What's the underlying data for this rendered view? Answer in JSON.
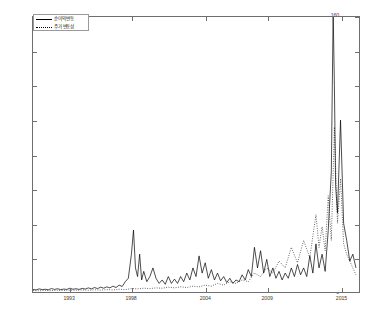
{
  "chart_data": {
    "type": "line",
    "title": "",
    "xlabel": "",
    "ylabel": "",
    "xlim": [
      1990.0,
      2016.5
    ],
    "ylim": [
      0,
      160
    ],
    "grid": false,
    "legend_position": "top-left",
    "x_ticks": [
      1993,
      1998,
      2004,
      2009,
      2015
    ],
    "x_tick_labels": [
      "1993",
      "1998",
      "2004",
      "2009",
      "2015"
    ],
    "y_ticks": [
      0,
      20,
      40,
      60,
      80,
      100,
      120,
      140,
      160
    ],
    "y_tick_labels": [
      "0",
      "20",
      "40",
      "60",
      "80",
      "100",
      "120",
      "140",
      "160"
    ],
    "series": [
      {
        "name": "순이익 변동",
        "style": "solid",
        "color": "#000000",
        "x": [
          1990.0,
          1990.25,
          1990.5,
          1990.75,
          1991.0,
          1991.25,
          1991.5,
          1991.75,
          1992.0,
          1992.25,
          1992.5,
          1992.75,
          1993.0,
          1993.25,
          1993.5,
          1993.75,
          1994.0,
          1994.25,
          1994.5,
          1994.75,
          1995.0,
          1995.25,
          1995.5,
          1995.75,
          1996.0,
          1996.25,
          1996.5,
          1996.75,
          1997.0,
          1997.25,
          1997.5,
          1997.75,
          1998.0,
          1998.17,
          1998.33,
          1998.5,
          1998.67,
          1998.83,
          1999.0,
          1999.25,
          1999.5,
          1999.75,
          2000.0,
          2000.25,
          2000.5,
          2000.75,
          2001.0,
          2001.25,
          2001.5,
          2001.75,
          2002.0,
          2002.25,
          2002.5,
          2002.75,
          2003.0,
          2003.25,
          2003.5,
          2003.75,
          2004.0,
          2004.25,
          2004.5,
          2004.75,
          2005.0,
          2005.25,
          2005.5,
          2005.75,
          2006.0,
          2006.25,
          2006.5,
          2006.75,
          2007.0,
          2007.25,
          2007.5,
          2007.75,
          2008.0,
          2008.25,
          2008.5,
          2008.75,
          2009.0,
          2009.25,
          2009.5,
          2009.75,
          2010.0,
          2010.25,
          2010.5,
          2010.75,
          2011.0,
          2011.25,
          2011.5,
          2011.75,
          2012.0,
          2012.25,
          2012.5,
          2012.75,
          2013.0,
          2013.25,
          2013.5,
          2013.75,
          2014.0,
          2014.25,
          2014.4,
          2014.5,
          2014.6,
          2014.75,
          2015.0,
          2015.25,
          2015.5,
          2015.75,
          2016.0,
          2016.25
        ],
        "values": [
          1.5,
          1.2,
          1.8,
          1.4,
          1.6,
          1.3,
          2.0,
          1.5,
          1.9,
          1.4,
          1.7,
          1.5,
          2.2,
          1.6,
          1.9,
          1.5,
          2.1,
          1.7,
          2.4,
          1.8,
          2.6,
          2.0,
          2.8,
          2.2,
          3.0,
          2.4,
          3.4,
          2.6,
          4.0,
          3.2,
          6.0,
          8.0,
          22.0,
          36.0,
          14.0,
          9.0,
          22.0,
          7.0,
          12.0,
          6.0,
          9.0,
          14.0,
          8.0,
          5.0,
          7.0,
          4.5,
          9.0,
          5.0,
          7.5,
          5.0,
          9.0,
          6.0,
          11.0,
          7.0,
          14.0,
          9.0,
          21.0,
          11.0,
          17.0,
          8.0,
          13.0,
          7.0,
          11.0,
          6.5,
          9.0,
          5.5,
          8.0,
          5.0,
          7.0,
          6.0,
          10.0,
          7.0,
          13.0,
          9.0,
          26.0,
          14.0,
          24.0,
          11.0,
          19.0,
          9.0,
          14.0,
          8.0,
          12.0,
          7.0,
          11.0,
          8.0,
          14.0,
          9.0,
          16.0,
          10.0,
          14.0,
          9.0,
          21.0,
          11.0,
          28.0,
          14.0,
          22.0,
          12.0,
          36.0,
          70.0,
          163.0,
          120.0,
          62.0,
          46.0,
          100.0,
          40.0,
          30.0,
          18.0,
          22.0,
          14.0
        ]
      },
      {
        "name": "주가 변동성",
        "style": "dotted",
        "color": "#000000",
        "x": [
          1990.0,
          1990.5,
          1991.0,
          1991.5,
          1992.0,
          1992.5,
          1993.0,
          1993.5,
          1994.0,
          1994.5,
          1995.0,
          1995.5,
          1996.0,
          1996.5,
          1997.0,
          1997.5,
          1998.0,
          1998.5,
          1999.0,
          1999.5,
          2000.0,
          2000.5,
          2001.0,
          2001.5,
          2002.0,
          2002.5,
          2003.0,
          2003.5,
          2004.0,
          2004.5,
          2005.0,
          2005.5,
          2006.0,
          2006.5,
          2007.0,
          2007.5,
          2008.0,
          2008.5,
          2009.0,
          2009.5,
          2010.0,
          2010.5,
          2011.0,
          2011.5,
          2012.0,
          2012.5,
          2013.0,
          2013.25,
          2013.5,
          2013.75,
          2014.0,
          2014.25,
          2014.5,
          2014.75,
          2015.0,
          2015.25,
          2015.5,
          2016.0,
          2016.25
        ],
        "values": [
          0.8,
          0.7,
          0.9,
          0.8,
          1.0,
          0.9,
          1.1,
          1.0,
          1.2,
          1.0,
          1.3,
          1.1,
          1.4,
          1.2,
          1.6,
          1.4,
          2.0,
          1.8,
          2.2,
          2.0,
          2.4,
          2.2,
          2.8,
          2.4,
          3.0,
          2.6,
          3.4,
          3.0,
          4.0,
          3.4,
          5.0,
          4.0,
          6.0,
          5.0,
          7.0,
          6.0,
          11.0,
          9.0,
          14.0,
          11.0,
          18.0,
          14.0,
          26.0,
          17.0,
          30.0,
          20.0,
          45.0,
          26.0,
          38.0,
          24.0,
          56.0,
          30.0,
          96.0,
          40.0,
          66.0,
          28.0,
          22.0,
          14.0,
          10.0
        ]
      }
    ]
  },
  "legend": {
    "entries": [
      {
        "label": "순이익 변동",
        "style": "solid"
      },
      {
        "label": "주가 변동성",
        "style": "dotted"
      }
    ]
  }
}
